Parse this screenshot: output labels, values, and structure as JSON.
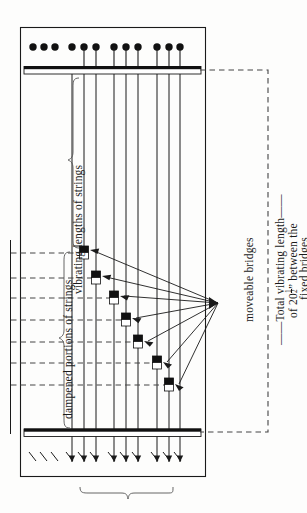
{
  "figure": {
    "labels": {
      "vibrating_lengths": "vibrating lengths of strings",
      "dampened_portions": "dampened portions of strings",
      "moveable_bridges": "moveable bridges",
      "total_vibrating_length_line1": "Total vibrating length",
      "total_vibrating_length_line2_prefix": "of 20",
      "total_vibrating_length_numerator": "1",
      "total_vibrating_length_denominator": "2",
      "total_vibrating_length_line2_suffix": "” between the",
      "total_vibrating_length_line3": "fixed bridges"
    },
    "colors": {
      "ink": "#1a1a1a",
      "paper": "#fdfdfc",
      "dash": "#555555",
      "bridge_fill": "#111111"
    },
    "geometry": {
      "frame": {
        "x": 20,
        "y": 27,
        "w": 185,
        "h": 449
      },
      "top_bridge": {
        "x": 24,
        "y": 66,
        "w": 177,
        "h": 8
      },
      "bottom_bridge": {
        "x": 24,
        "y": 428,
        "w": 177,
        "h": 8
      },
      "converge_point": {
        "x": 218,
        "y": 303
      },
      "dashed_vertical_x": 268,
      "dashed_left_x": 10
    },
    "tuning_pins": [
      {
        "x": 33,
        "y": 47,
        "r": 3.6,
        "has_string": false
      },
      {
        "x": 44,
        "y": 47,
        "r": 3.6,
        "has_string": false
      },
      {
        "x": 55,
        "y": 47,
        "r": 3.6,
        "has_string": false
      },
      {
        "x": 72,
        "y": 47,
        "r": 3.6,
        "has_string": false
      },
      {
        "x": 84,
        "y": 47,
        "r": 3.6,
        "has_string": true
      },
      {
        "x": 96,
        "y": 47,
        "r": 3.6,
        "has_string": true
      },
      {
        "x": 114,
        "y": 47,
        "r": 3.6,
        "has_string": true
      },
      {
        "x": 126,
        "y": 47,
        "r": 3.6,
        "has_string": true
      },
      {
        "x": 138,
        "y": 47,
        "r": 3.6,
        "has_string": true
      },
      {
        "x": 157,
        "y": 47,
        "r": 3.6,
        "has_string": true
      },
      {
        "x": 169,
        "y": 47,
        "r": 3.6,
        "has_string": true
      },
      {
        "x": 180,
        "y": 47,
        "r": 3.6,
        "has_string": true
      }
    ],
    "strings": [
      {
        "x": 84
      },
      {
        "x": 96
      },
      {
        "x": 114
      },
      {
        "x": 126
      },
      {
        "x": 138
      },
      {
        "x": 157
      },
      {
        "x": 169
      },
      {
        "x": 180
      }
    ],
    "extra_string_lines": [
      {
        "x": 72
      }
    ],
    "moveable_bridges": [
      {
        "x": 84,
        "y": 253
      },
      {
        "x": 96,
        "y": 278
      },
      {
        "x": 114,
        "y": 298
      },
      {
        "x": 126,
        "y": 320
      },
      {
        "x": 138,
        "y": 342
      },
      {
        "x": 157,
        "y": 363
      },
      {
        "x": 169,
        "y": 385
      }
    ],
    "dashed_rows": [
      253,
      278,
      298,
      320,
      342,
      363,
      385
    ],
    "bottom_arrows": [
      {
        "x": 33,
        "short": true
      },
      {
        "x": 44,
        "short": true
      },
      {
        "x": 55,
        "short": true
      },
      {
        "x": 72,
        "short": true
      },
      {
        "x": 84,
        "short": false
      },
      {
        "x": 96,
        "short": false
      },
      {
        "x": 114,
        "short": false
      },
      {
        "x": 126,
        "short": false
      },
      {
        "x": 138,
        "short": false
      },
      {
        "x": 157,
        "short": false
      },
      {
        "x": 169,
        "short": false
      },
      {
        "x": 180,
        "short": false
      }
    ],
    "bottom_brace": {
      "x1": 80,
      "x2": 175,
      "y": 489,
      "tip_y": 498
    }
  }
}
